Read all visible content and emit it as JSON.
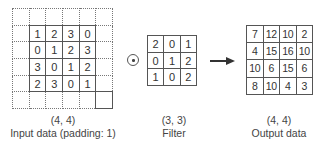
{
  "diagram": {
    "input": {
      "shape_label": "(4, 4)",
      "caption": "Input data (padding: 1)",
      "padding": 1,
      "values": [
        [
          1,
          2,
          3,
          0
        ],
        [
          0,
          1,
          2,
          3
        ],
        [
          3,
          0,
          1,
          2
        ],
        [
          2,
          3,
          0,
          1
        ]
      ]
    },
    "operator": {
      "symbol": "⊙",
      "icon": "circled-dot-operator-icon"
    },
    "filter": {
      "shape_label": "(3, 3)",
      "caption": "Filter",
      "values": [
        [
          2,
          0,
          1
        ],
        [
          0,
          1,
          2
        ],
        [
          1,
          0,
          2
        ]
      ]
    },
    "arrow": {
      "icon": "right-arrow-icon"
    },
    "output": {
      "shape_label": "(4, 4)",
      "caption": "Output data",
      "values": [
        [
          7,
          12,
          10,
          2
        ],
        [
          4,
          15,
          16,
          10
        ],
        [
          10,
          6,
          15,
          6
        ],
        [
          8,
          10,
          4,
          3
        ]
      ]
    },
    "colors": {
      "line": "#555555",
      "text": "#333333",
      "background": "#ffffff"
    }
  }
}
